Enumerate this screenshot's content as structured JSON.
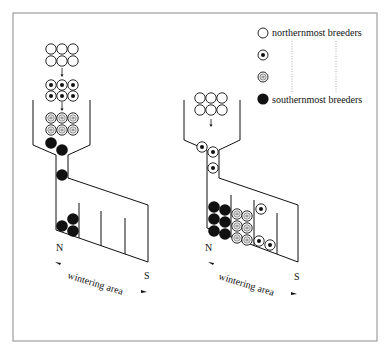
{
  "legend": {
    "items": [
      {
        "type": "open",
        "label": "northernmost breeders"
      },
      {
        "type": "dot",
        "label": ""
      },
      {
        "type": "equal",
        "label": ""
      },
      {
        "type": "filled",
        "label": "southernmost breeders"
      }
    ]
  },
  "left_panel": {
    "north_label": "N",
    "south_label": "S",
    "axis_label": "wintering area",
    "queue": [
      [
        "open",
        "open",
        "open"
      ],
      [
        "open",
        "open",
        "open"
      ],
      [
        "dot",
        "dot",
        "dot"
      ],
      [
        "dot",
        "dot",
        "dot"
      ],
      [
        "equal",
        "equal",
        "equal"
      ],
      [
        "equal",
        "equal",
        "equal"
      ]
    ],
    "compartment_count": 4
  },
  "right_panel": {
    "north_label": "N",
    "south_label": "S",
    "axis_label": "wintering area",
    "queue": [
      [
        "open",
        "open",
        "open"
      ],
      [
        "open",
        "open",
        "open"
      ]
    ],
    "compartment_count": 4
  },
  "colors": {
    "ink": "#111111",
    "frame": "#888888",
    "dotted": "#999999"
  }
}
